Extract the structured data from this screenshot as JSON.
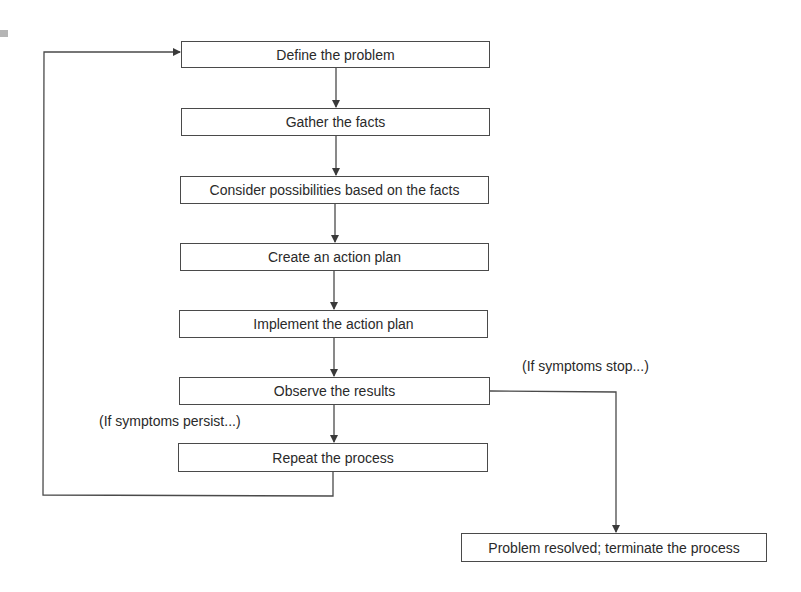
{
  "diagram": {
    "type": "flowchart",
    "steps": [
      {
        "id": "define",
        "label": "Define the problem"
      },
      {
        "id": "gather",
        "label": "Gather the facts"
      },
      {
        "id": "consider",
        "label": "Consider possibilities based on the facts"
      },
      {
        "id": "plan",
        "label": "Create an action plan"
      },
      {
        "id": "implement",
        "label": "Implement the action plan"
      },
      {
        "id": "observe",
        "label": "Observe the results"
      },
      {
        "id": "repeat",
        "label": "Repeat the process"
      }
    ],
    "terminal": {
      "id": "resolved",
      "label": "Problem resolved; terminate the process"
    },
    "branch_labels": {
      "persist": "(If symptoms persist...)",
      "stop": "(If symptoms stop...)"
    },
    "edges": [
      {
        "from": "define",
        "to": "gather"
      },
      {
        "from": "gather",
        "to": "consider"
      },
      {
        "from": "consider",
        "to": "plan"
      },
      {
        "from": "plan",
        "to": "implement"
      },
      {
        "from": "implement",
        "to": "observe"
      },
      {
        "from": "observe",
        "to": "repeat",
        "label": "(If symptoms persist...)"
      },
      {
        "from": "observe",
        "to": "resolved",
        "label": "(If symptoms stop...)"
      },
      {
        "from": "repeat",
        "to": "define"
      }
    ],
    "colors": {
      "line": "#4a4a4a",
      "box_border": "#4a4a4a",
      "text": "#2a2a2a",
      "background": "#ffffff"
    }
  }
}
